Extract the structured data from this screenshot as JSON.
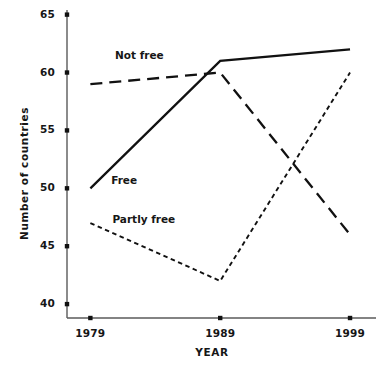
{
  "chart_data": {
    "type": "line",
    "title": "",
    "xlabel": "YEAR",
    "ylabel": "Number of countries",
    "x": [
      1979,
      1989,
      1999
    ],
    "xtick_labels": [
      "1979",
      "1989",
      "1999"
    ],
    "ytick_labels": [
      "65",
      "60",
      "55",
      "50",
      "45",
      "40"
    ],
    "ytick_values": [
      65,
      60,
      55,
      50,
      45,
      40
    ],
    "ylim": [
      38.8,
      65.4
    ],
    "xlim": [
      1977.2,
      2001.0
    ],
    "grid": false,
    "legend": "inline-labels",
    "series": [
      {
        "name": "Not free",
        "label": "Not free",
        "style": "long-dashed",
        "color": "#111111",
        "values": [
          59,
          60,
          46
        ],
        "label_x": 1980.9,
        "label_y": 61.4
      },
      {
        "name": "Free",
        "label": "Free",
        "style": "solid",
        "color": "#111111",
        "values": [
          50,
          61,
          62
        ],
        "label_x": 1980.6,
        "label_y": 50.6
      },
      {
        "name": "Partly free",
        "label": "Partly free",
        "style": "short-dashed",
        "color": "#111111",
        "values": [
          47,
          42,
          60
        ],
        "label_x": 1980.7,
        "label_y": 47.3
      }
    ]
  },
  "axes": {
    "x_axis_name": "year-axis",
    "y_axis_name": "countries-axis"
  }
}
